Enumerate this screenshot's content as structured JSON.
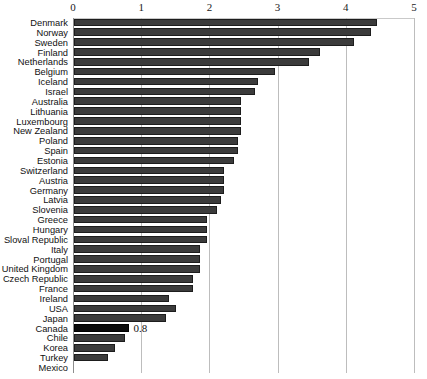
{
  "chart_data": {
    "type": "bar",
    "orientation": "horizontal",
    "title": "",
    "xlabel": "",
    "ylabel": "",
    "xlim": [
      0,
      5
    ],
    "xticks": [
      "0",
      "1",
      "2",
      "3",
      "4",
      "5"
    ],
    "grid": true,
    "legend": false,
    "categories": [
      "Denmark",
      "Norway",
      "Sweden",
      "Finland",
      "Netherlands",
      "Belgium",
      "Iceland",
      "Israel",
      "Australia",
      "Lithuania",
      "Luxembourg",
      "New Zealand",
      "Poland",
      "Spain",
      "Estonia",
      "Switzerland",
      "Austria",
      "Germany",
      "Latvia",
      "Slovenia",
      "Greece",
      "Hungary",
      "Sloval Republic",
      "Italy",
      "Portugal",
      "United Kingdom",
      "Czech Republic",
      "France",
      "Ireland",
      "USA",
      "Japan",
      "Canada",
      "Chile",
      "Korea",
      "Turkey",
      "Mexico"
    ],
    "values": [
      4.45,
      4.35,
      4.1,
      3.6,
      3.45,
      2.95,
      2.7,
      2.65,
      2.45,
      2.45,
      2.45,
      2.45,
      2.4,
      2.4,
      2.35,
      2.2,
      2.2,
      2.2,
      2.15,
      2.1,
      1.95,
      1.95,
      1.95,
      1.85,
      1.85,
      1.85,
      1.75,
      1.75,
      1.4,
      1.5,
      1.35,
      0.8,
      0.75,
      0.6,
      0.5,
      0.0
    ],
    "highlight_category": "Canada",
    "data_labels": {
      "Canada": "0.8"
    },
    "colors": {
      "bar": "#3b3b3b",
      "bar_border": "#1d1d1d",
      "highlight_bar": "#0b0b0b",
      "gridline": "#bdbdbd",
      "axis": "#8d8d8d",
      "text": "#111111",
      "background": "#ffffff"
    }
  }
}
